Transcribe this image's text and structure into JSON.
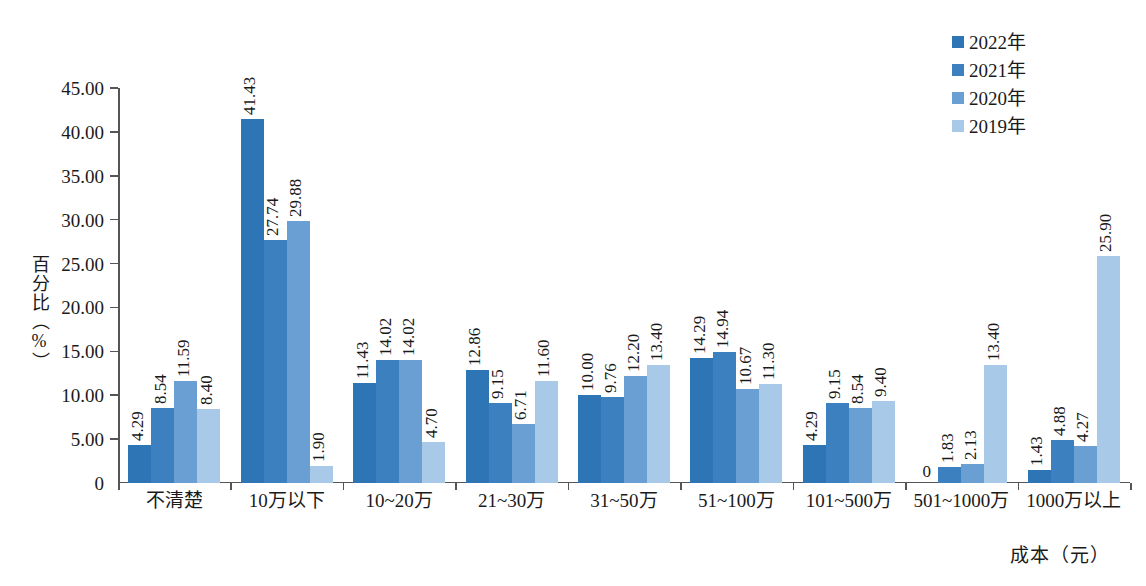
{
  "chart_data": {
    "type": "bar",
    "title": "",
    "subtitle": "",
    "xlabel": "成本（元）",
    "ylabel": "百分比（%）",
    "ylim": [
      0,
      45
    ],
    "ytick_labels": [
      "0",
      "5.00",
      "10.00",
      "15.00",
      "20.00",
      "25.00",
      "30.00",
      "35.00",
      "40.00",
      "45.00"
    ],
    "ytick_values": [
      0,
      5,
      10,
      15,
      20,
      25,
      30,
      35,
      40,
      45
    ],
    "grid": false,
    "legend_position": "top-right",
    "categories": [
      "不清楚",
      "10万以下",
      "10~20万",
      "21~30万",
      "31~50万",
      "51~100万",
      "101~500万",
      "501~1000万",
      "1000万以上"
    ],
    "series": [
      {
        "name": "2022年",
        "color": "#2e75b6",
        "values": [
          4.29,
          41.43,
          11.43,
          12.86,
          10.0,
          14.29,
          4.29,
          0,
          1.43
        ],
        "labels": [
          "4.29",
          "41.43",
          "11.43",
          "12.86",
          "10.00",
          "14.29",
          "4.29",
          "0",
          "1.43"
        ]
      },
      {
        "name": "2021年",
        "color": "#3d80bf",
        "values": [
          8.54,
          27.74,
          14.02,
          9.15,
          9.76,
          14.94,
          9.15,
          1.83,
          4.88
        ],
        "labels": [
          "8.54",
          "27.74",
          "14.02",
          "9.15",
          "9.76",
          "14.94",
          "9.15",
          "1.83",
          "4.88"
        ]
      },
      {
        "name": "2020年",
        "color": "#6a9fd4",
        "values": [
          11.59,
          29.88,
          14.02,
          6.71,
          12.2,
          10.67,
          8.54,
          2.13,
          4.27
        ],
        "labels": [
          "11.59",
          "29.88",
          "14.02",
          "6.71",
          "12.20",
          "10.67",
          "8.54",
          "2.13",
          "4.27"
        ]
      },
      {
        "name": "2019年",
        "color": "#a9c9e8",
        "values": [
          8.4,
          1.9,
          4.7,
          11.6,
          13.4,
          11.3,
          9.4,
          13.4,
          25.9
        ],
        "labels": [
          "8.40",
          "1.90",
          "4.70",
          "11.60",
          "13.40",
          "11.30",
          "9.40",
          "13.40",
          "25.90"
        ]
      }
    ]
  }
}
